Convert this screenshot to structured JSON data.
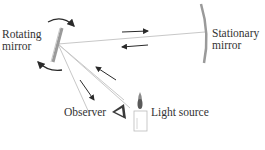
{
  "diagram": {
    "labels": {
      "rotating_mirror": [
        "Rotating",
        "mirror"
      ],
      "stationary_mirror": [
        "Stationary",
        "mirror"
      ],
      "observer": "Observer",
      "light_source": "Light source"
    },
    "colors": {
      "beam": "#c8c8c8",
      "arrow": "#2a2a2a",
      "mirror": "#9a9a9a",
      "text": "#333333"
    }
  }
}
